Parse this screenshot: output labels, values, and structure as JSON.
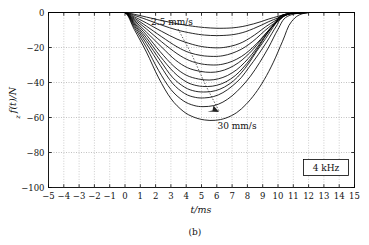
{
  "figure": {
    "caption": "(b)",
    "legend_label": "4 kHz"
  },
  "annotations": {
    "top_label": "2.5 mm/s",
    "bottom_label": "30 mm/s"
  },
  "axes": {
    "x_title": "t/ms",
    "y_title": "f(t)/N",
    "y_title_subscript": "z",
    "x_ticks": [
      "−5",
      "−4",
      "−3",
      "−2",
      "−1",
      "0",
      "1",
      "2",
      "3",
      "4",
      "5",
      "6",
      "7",
      "8",
      "9",
      "10",
      "11",
      "12",
      "13",
      "14",
      "15"
    ],
    "y_ticks": [
      "0",
      "−20",
      "−40",
      "−60",
      "−80",
      "−100"
    ]
  },
  "chart_data": {
    "type": "line",
    "title": "",
    "subtitle": "",
    "xlabel": "t/ms",
    "ylabel": "f_z(t)/N",
    "xlim": [
      -5,
      15
    ],
    "ylim": [
      -100,
      0
    ],
    "grid": true,
    "legend_position": "bottom-right",
    "legend_entries": [
      "4 kHz"
    ],
    "annotations": [
      {
        "text": "2.5 mm/s",
        "x": 2.6,
        "y": 2.5,
        "points_to": {
          "x": 5.6,
          "y": -43
        }
      },
      {
        "text": "30 mm/s",
        "x": 7.6,
        "y": -55
      }
    ],
    "x_ticks": [
      -5,
      -4,
      -3,
      -2,
      -1,
      0,
      1,
      2,
      3,
      4,
      5,
      6,
      7,
      8,
      9,
      10,
      11,
      12,
      13,
      14,
      15
    ],
    "y_ticks": [
      0,
      -20,
      -40,
      -60,
      -80,
      -100
    ],
    "series_parameter": {
      "name": "feed rate",
      "unit": "mm/s",
      "values": [
        2.5,
        5,
        7.5,
        10,
        12.5,
        15,
        17.5,
        20,
        22.5,
        25,
        27.5,
        30
      ]
    },
    "series": [
      {
        "name": "2.5 mm/s",
        "x": [
          -5,
          -1,
          0,
          0.6,
          1.4,
          2.4,
          3.4,
          4.4,
          5.2,
          6.0,
          6.8,
          7.4,
          7.9,
          8.4,
          8.9,
          9.4,
          10.0,
          10.6,
          11.0,
          12,
          15
        ],
        "values": [
          0,
          0,
          0,
          -1.0,
          -2.6,
          -4.6,
          -6.4,
          -7.8,
          -8.6,
          -9.0,
          -8.9,
          -8.4,
          -7.6,
          -6.5,
          -5.2,
          -3.7,
          -2.2,
          -0.9,
          -0.2,
          0,
          0
        ]
      },
      {
        "name": "5 mm/s",
        "x": [
          -5,
          -1,
          0,
          0.6,
          1.4,
          2.4,
          3.4,
          4.4,
          5.2,
          6.0,
          6.8,
          7.4,
          7.9,
          8.4,
          8.9,
          9.4,
          10.0,
          10.6,
          11.0,
          12,
          15
        ],
        "values": [
          0,
          0,
          0,
          -1.6,
          -4.0,
          -7.2,
          -10.0,
          -11.9,
          -12.9,
          -13.2,
          -12.9,
          -12.1,
          -10.9,
          -9.2,
          -7.3,
          -5.2,
          -3.1,
          -1.3,
          -0.3,
          0,
          0
        ]
      },
      {
        "name": "7.5 mm/s",
        "x": [
          -5,
          -1,
          0,
          0.6,
          1.4,
          2.4,
          3.4,
          4.4,
          5.2,
          6.0,
          6.6,
          7.2,
          7.7,
          8.2,
          8.7,
          9.2,
          9.8,
          10.4,
          10.9,
          12,
          15
        ],
        "values": [
          0,
          0,
          0,
          -2.4,
          -6.0,
          -10.8,
          -15.2,
          -18.2,
          -19.7,
          -20.2,
          -19.8,
          -18.6,
          -16.9,
          -14.4,
          -11.4,
          -8.1,
          -4.8,
          -2.0,
          -0.5,
          0,
          0
        ]
      },
      {
        "name": "10 mm/s",
        "x": [
          -5,
          -1,
          0,
          0.6,
          1.4,
          2.4,
          3.4,
          4.2,
          5.0,
          5.8,
          6.4,
          7.0,
          7.6,
          8.1,
          8.6,
          9.1,
          9.7,
          10.3,
          10.8,
          12,
          15
        ],
        "values": [
          0,
          0,
          0,
          -3.1,
          -7.8,
          -13.9,
          -19.6,
          -22.9,
          -24.6,
          -25.1,
          -24.7,
          -23.3,
          -21.0,
          -18.2,
          -14.7,
          -10.7,
          -6.4,
          -2.7,
          -0.6,
          0,
          0
        ]
      },
      {
        "name": "12.5 mm/s",
        "x": [
          -5,
          -1,
          0,
          0.6,
          1.4,
          2.4,
          3.4,
          4.2,
          5.0,
          5.8,
          6.4,
          7.0,
          7.6,
          8.1,
          8.6,
          9.1,
          9.6,
          10.2,
          10.7,
          12,
          15
        ],
        "values": [
          0,
          0,
          0,
          -3.8,
          -9.4,
          -16.8,
          -23.5,
          -27.4,
          -29.4,
          -30.0,
          -29.5,
          -27.9,
          -25.2,
          -21.9,
          -17.8,
          -13.0,
          -8.2,
          -3.6,
          -0.8,
          0,
          0
        ]
      },
      {
        "name": "15 mm/s",
        "x": [
          -5,
          -1,
          0,
          0.6,
          1.4,
          2.4,
          3.3,
          4.1,
          4.9,
          5.6,
          6.2,
          6.8,
          7.4,
          7.9,
          8.4,
          8.9,
          9.4,
          10.0,
          10.5,
          12,
          15
        ],
        "values": [
          0,
          0,
          0,
          -4.5,
          -11.2,
          -19.8,
          -27.2,
          -31.6,
          -33.6,
          -34.2,
          -33.6,
          -31.8,
          -28.8,
          -25.2,
          -20.8,
          -15.5,
          -10.0,
          -4.5,
          -1.0,
          0,
          0
        ]
      },
      {
        "name": "17.5 mm/s",
        "x": [
          -5,
          -1,
          0,
          0.6,
          1.4,
          2.3,
          3.2,
          4.0,
          4.8,
          5.5,
          6.1,
          6.7,
          7.3,
          7.8,
          8.3,
          8.8,
          9.3,
          9.9,
          10.4,
          12,
          15
        ],
        "values": [
          0,
          0,
          0,
          -5.2,
          -12.8,
          -22.4,
          -30.8,
          -35.8,
          -38.0,
          -38.6,
          -37.9,
          -36.0,
          -32.7,
          -28.7,
          -23.8,
          -17.9,
          -11.7,
          -5.3,
          -1.2,
          0,
          0
        ]
      },
      {
        "name": "20 mm/s",
        "x": [
          -5,
          -1,
          0,
          0.6,
          1.4,
          2.3,
          3.2,
          4.0,
          4.7,
          5.4,
          6.0,
          6.6,
          7.2,
          7.7,
          8.2,
          8.7,
          9.2,
          9.8,
          10.3,
          12,
          15
        ],
        "values": [
          0,
          0,
          0,
          -5.9,
          -14.4,
          -25.0,
          -34.2,
          -39.6,
          -41.8,
          -42.3,
          -41.6,
          -39.6,
          -36.1,
          -31.8,
          -26.5,
          -20.1,
          -13.3,
          -6.1,
          -1.4,
          0,
          0
        ]
      },
      {
        "name": "22.5 mm/s",
        "x": [
          -5,
          -1,
          0,
          0.6,
          1.4,
          2.3,
          3.1,
          3.9,
          4.6,
          5.3,
          5.9,
          6.5,
          7.1,
          7.6,
          8.1,
          8.6,
          9.2,
          9.8,
          10.3,
          12,
          15
        ],
        "values": [
          0,
          0,
          0,
          -6.6,
          -16.0,
          -27.4,
          -37.0,
          -42.7,
          -45.0,
          -45.4,
          -44.7,
          -42.6,
          -39.0,
          -34.5,
          -28.9,
          -22.2,
          -14.8,
          -6.9,
          -1.6,
          0,
          0
        ]
      },
      {
        "name": "25 mm/s",
        "x": [
          -5,
          -1,
          0,
          0.6,
          1.4,
          2.3,
          3.1,
          3.9,
          4.6,
          5.2,
          5.8,
          6.4,
          7.0,
          7.6,
          8.1,
          8.7,
          9.3,
          9.9,
          10.4,
          12,
          15
        ],
        "values": [
          0,
          0,
          0,
          -7.4,
          -17.8,
          -30.2,
          -40.4,
          -46.3,
          -48.5,
          -48.8,
          -48.0,
          -45.8,
          -42.1,
          -37.2,
          -31.4,
          -24.2,
          -16.3,
          -7.7,
          -1.8,
          0,
          0
        ]
      },
      {
        "name": "27.5 mm/s",
        "x": [
          -5,
          -1,
          0,
          0.6,
          1.4,
          2.2,
          3.0,
          3.8,
          4.5,
          5.1,
          5.8,
          6.4,
          7.0,
          7.6,
          8.2,
          8.8,
          9.4,
          10.0,
          10.6,
          12,
          15
        ],
        "values": [
          0,
          0,
          0,
          -8.4,
          -20.0,
          -33.2,
          -44.0,
          -50.4,
          -53.1,
          -53.8,
          -53.2,
          -51.2,
          -47.6,
          -42.6,
          -36.4,
          -28.6,
          -19.7,
          -9.6,
          -2.3,
          0,
          0
        ]
      },
      {
        "name": "30 mm/s",
        "x": [
          -5,
          -1,
          0,
          0.6,
          1.4,
          2.2,
          3.0,
          3.8,
          4.5,
          5.2,
          5.9,
          6.6,
          7.3,
          7.9,
          8.5,
          9.1,
          9.7,
          10.3,
          10.9,
          12,
          15
        ],
        "values": [
          0,
          0,
          0,
          -9.6,
          -22.6,
          -37.4,
          -49.2,
          -56.4,
          -59.8,
          -61.4,
          -61.6,
          -60.3,
          -57.2,
          -52.6,
          -46.4,
          -38.4,
          -28.4,
          -16.4,
          -5.0,
          0,
          0
        ]
      }
    ]
  }
}
